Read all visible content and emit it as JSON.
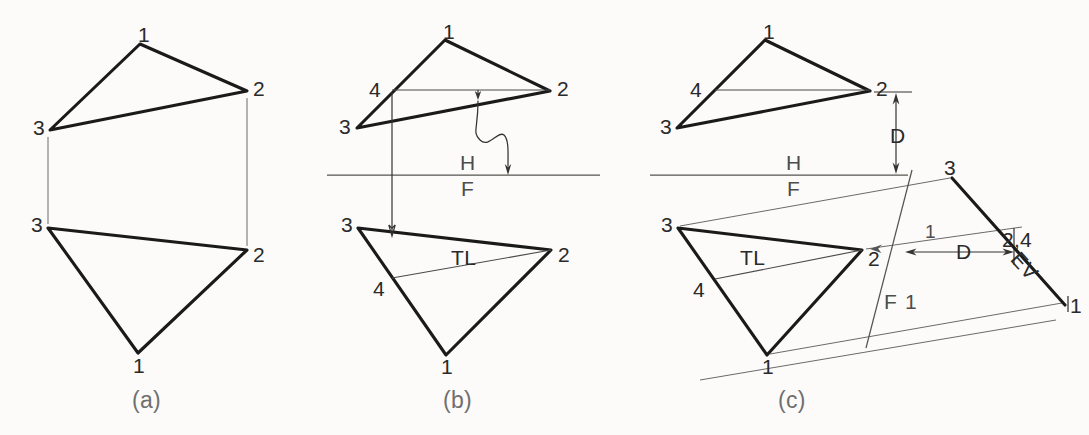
{
  "figure": {
    "background_color": "#fcfbf9",
    "line_color": "#1a1a1a",
    "thin_line_color": "#4a4a4a"
  },
  "panels": [
    {
      "key": "a",
      "caption": "(a)",
      "caption_x": 132,
      "caption_y": 389,
      "description": "Given top and front views of plane 1-2-3"
    },
    {
      "key": "b",
      "caption": "(b)",
      "caption_x": 443,
      "caption_y": 389,
      "description": "True length line 4-2 drawn in the top view and projected to the front view"
    },
    {
      "key": "c",
      "caption": "(c)",
      "caption_x": 778,
      "caption_y": 389,
      "description": "Auxiliary view taken perpendicular to the true length line gives the edge view"
    }
  ],
  "vertex_labels": {
    "panel_a": [
      {
        "text": "1",
        "x": 138,
        "y": 24
      },
      {
        "text": "2",
        "x": 253,
        "y": 78
      },
      {
        "text": "3",
        "x": 33,
        "y": 117
      },
      {
        "text": "3",
        "x": 31,
        "y": 214
      },
      {
        "text": "2",
        "x": 253,
        "y": 244
      },
      {
        "text": "1",
        "x": 133,
        "y": 355
      }
    ],
    "panel_b": [
      {
        "text": "1",
        "x": 443,
        "y": 21
      },
      {
        "text": "2",
        "x": 557,
        "y": 78
      },
      {
        "text": "4",
        "x": 369,
        "y": 79
      },
      {
        "text": "3",
        "x": 339,
        "y": 116
      },
      {
        "text": "3",
        "x": 341,
        "y": 214
      },
      {
        "text": "2",
        "x": 558,
        "y": 244
      },
      {
        "text": "4",
        "x": 373,
        "y": 278
      },
      {
        "text": "1",
        "x": 441,
        "y": 356
      },
      {
        "text": "TL",
        "x": 451,
        "y": 247
      }
    ],
    "panel_c": [
      {
        "text": "1",
        "x": 763,
        "y": 21
      },
      {
        "text": "2",
        "x": 876,
        "y": 78
      },
      {
        "text": "4",
        "x": 690,
        "y": 79
      },
      {
        "text": "3",
        "x": 660,
        "y": 116
      },
      {
        "text": "3",
        "x": 661,
        "y": 214
      },
      {
        "text": "2",
        "x": 868,
        "y": 248
      },
      {
        "text": "4",
        "x": 693,
        "y": 279
      },
      {
        "text": "1",
        "x": 762,
        "y": 356
      },
      {
        "text": "TL",
        "x": 740,
        "y": 247
      }
    ],
    "panel_c_aux": [
      {
        "text": "3",
        "x": 944,
        "y": 157
      },
      {
        "text": "2,4",
        "x": 1002,
        "y": 229
      },
      {
        "text": "1",
        "x": 1070,
        "y": 295
      },
      {
        "text": "1",
        "x": 925,
        "y": 222
      }
    ]
  },
  "annotations": {
    "fold_line_h": {
      "text": "H",
      "x": 460,
      "y": 152
    },
    "fold_line_f": {
      "text": "F",
      "x": 461,
      "y": 178
    },
    "fold_line_h_c": {
      "text": "H",
      "x": 786,
      "y": 152
    },
    "fold_line_f_c": {
      "text": "F",
      "x": 787,
      "y": 178
    },
    "fold_line_f1_f": {
      "text": "F",
      "x": 884,
      "y": 291
    },
    "fold_line_f1_1": {
      "text": "1",
      "x": 905,
      "y": 291
    },
    "edge_view": {
      "text": "EV",
      "x": 1023,
      "y": 248
    },
    "true_length_b": {
      "text": "TL",
      "x": 451,
      "y": 247
    },
    "true_length_c": {
      "text": "TL",
      "x": 740,
      "y": 247
    },
    "dim_d_vertical": {
      "text": "D",
      "x": 890,
      "y": 125
    },
    "dim_d_horizontal": {
      "text": "D",
      "x": 956,
      "y": 254
    }
  },
  "geometry": {
    "panel_a": {
      "top_view": {
        "v1": [
          140,
          44
        ],
        "v2": [
          247,
          91
        ],
        "v3": [
          50,
          130
        ]
      },
      "front_view": {
        "v1": [
          138,
          353
        ],
        "v2": [
          247,
          250
        ],
        "v3": [
          48,
          228
        ]
      },
      "projector_left": {
        "x": 48,
        "y1": 136,
        "y2": 224
      },
      "projector_right": {
        "x": 247,
        "y1": 97,
        "y2": 246
      }
    },
    "panel_b": {
      "top_view": {
        "v1": [
          445,
          40
        ],
        "v2": [
          550,
          91
        ],
        "v3": [
          357,
          128
        ],
        "v4": [
          392,
          90
        ]
      },
      "front_view": {
        "v1": [
          446,
          355
        ],
        "v2": [
          551,
          250
        ],
        "v3": [
          358,
          228
        ],
        "v4": [
          392,
          278
        ]
      },
      "fold_line": {
        "x1": 327,
        "x2": 600,
        "y": 175
      },
      "projector_4": {
        "x": 392,
        "y1": 92,
        "y2": 232
      },
      "wavy_arrow": {
        "from": [
          478,
          93
        ],
        "to": [
          508,
          172
        ]
      }
    },
    "panel_c": {
      "top_view": {
        "v1": [
          765,
          40
        ],
        "v2": [
          870,
          91
        ],
        "v3": [
          677,
          128
        ],
        "v4": [
          715,
          90
        ]
      },
      "front_view": {
        "v1": [
          767,
          355
        ],
        "v2": [
          862,
          250
        ],
        "v3": [
          678,
          228
        ],
        "v4": [
          715,
          279
        ]
      },
      "fold_line": {
        "x1": 650,
        "x2": 908,
        "y": 175
      },
      "aux_fold_line": {
        "x1": 910,
        "y1": 172,
        "x2": 866,
        "y2": 345
      },
      "edge_view_line": {
        "from": [
          952,
          178
        ],
        "to": [
          1065,
          305
        ]
      },
      "aux_proj_3": {
        "from": [
          678,
          228
        ],
        "to": [
          952,
          178
        ]
      },
      "aux_proj_2": {
        "from": [
          862,
          250
        ],
        "to": [
          1022,
          228
        ]
      },
      "aux_proj_1": {
        "from": [
          767,
          355
        ],
        "to": [
          1063,
          303
        ]
      },
      "dim_d_vertical": {
        "x": 896,
        "y1": 93,
        "y2": 174
      },
      "dim_d_horizontal": {
        "y": 252,
        "x1": 905,
        "x2": 1012
      }
    }
  }
}
